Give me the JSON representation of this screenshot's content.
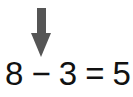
{
  "arrow": {
    "direction": "down",
    "icon": "down-arrow-icon",
    "color": "#555555",
    "points_to": "8"
  },
  "equation": {
    "operand1": "8",
    "operator": "−",
    "operand2": "3",
    "equals": "=",
    "result": "5"
  }
}
